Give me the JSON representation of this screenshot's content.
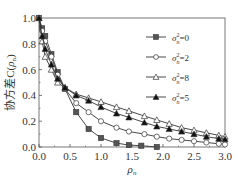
{
  "chart_data": {
    "type": "line",
    "title": "",
    "xlabel": "ρn",
    "ylabel": "协方差C(ρn)",
    "xlim": [
      0,
      3
    ],
    "ylim": [
      0,
      1
    ],
    "xticks": [
      "0.0",
      "0.5",
      "1.0",
      "1.5",
      "2.0",
      "2.5",
      "3.0"
    ],
    "yticks": [
      "0.0",
      "0.2",
      "0.4",
      "0.6",
      "0.8",
      "1.0"
    ],
    "grid": false,
    "legend_position": "upper right",
    "series": [
      {
        "name": "σn²=0",
        "marker": "filled-square",
        "x": [
          0,
          0.05,
          0.1,
          0.2,
          0.3,
          0.42,
          0.6,
          0.8,
          1.0,
          1.25,
          1.45,
          1.65,
          1.9
        ],
        "values": [
          1.0,
          0.92,
          0.86,
          0.72,
          0.58,
          0.45,
          0.27,
          0.14,
          0.07,
          0.03,
          0.015,
          0.01,
          0.0
        ]
      },
      {
        "name": "σn²=2",
        "marker": "open-circle",
        "x": [
          0,
          0.05,
          0.1,
          0.2,
          0.3,
          0.42,
          0.6,
          0.8,
          1.0,
          1.25,
          1.45,
          1.7,
          1.9,
          2.1,
          2.3,
          2.5,
          2.7,
          2.9,
          3.0
        ],
        "values": [
          1.0,
          0.9,
          0.82,
          0.7,
          0.56,
          0.45,
          0.34,
          0.27,
          0.2,
          0.15,
          0.12,
          0.1,
          0.08,
          0.065,
          0.055,
          0.045,
          0.035,
          0.025,
          0.02
        ]
      },
      {
        "name": "σn²=8",
        "marker": "open-triangle",
        "x": [
          0,
          0.05,
          0.1,
          0.2,
          0.3,
          0.42,
          0.6,
          0.8,
          1.0,
          1.25,
          1.45,
          1.7,
          1.9,
          2.1,
          2.3,
          2.5,
          2.7,
          2.9,
          3.0
        ],
        "values": [
          1.0,
          0.82,
          0.7,
          0.6,
          0.5,
          0.46,
          0.41,
          0.38,
          0.35,
          0.31,
          0.28,
          0.24,
          0.21,
          0.18,
          0.15,
          0.13,
          0.11,
          0.09,
          0.08
        ]
      },
      {
        "name": "σn²=5",
        "marker": "filled-triangle",
        "x": [
          0,
          0.05,
          0.1,
          0.2,
          0.3,
          0.42,
          0.6,
          0.8,
          1.0,
          1.25,
          1.45,
          1.7,
          1.9,
          2.1,
          2.3,
          2.5,
          2.7,
          2.9,
          3.0
        ],
        "values": [
          1.0,
          0.86,
          0.76,
          0.64,
          0.53,
          0.46,
          0.4,
          0.36,
          0.31,
          0.26,
          0.23,
          0.19,
          0.16,
          0.14,
          0.12,
          0.1,
          0.08,
          0.065,
          0.06
        ]
      }
    ]
  }
}
